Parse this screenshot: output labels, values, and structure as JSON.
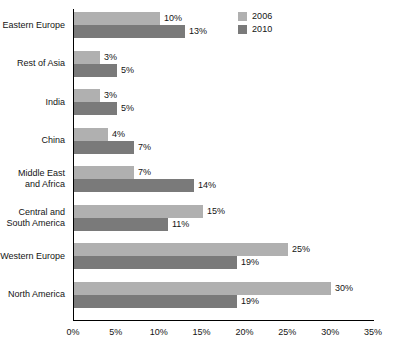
{
  "chart_data": {
    "type": "bar",
    "orientation": "horizontal",
    "title": "",
    "xlabel": "",
    "ylabel": "",
    "xlim": [
      0,
      35
    ],
    "grid": false,
    "legend_position": "top-right",
    "value_suffix": "%",
    "categories": [
      "Eastern Europe",
      "Rest of Asia",
      "India",
      "China",
      "Middle East\nand Africa",
      "Central and\nSouth America",
      "Western Europe",
      "North America"
    ],
    "series": [
      {
        "name": "2006",
        "color": "#b0b0b0",
        "values": [
          10,
          3,
          3,
          4,
          7,
          15,
          25,
          30
        ],
        "labels": [
          "10%",
          "3%",
          "3%",
          "4%",
          "7%",
          "15%",
          "25%",
          "30%"
        ]
      },
      {
        "name": "2010",
        "color": "#7a7a7a",
        "values": [
          13,
          5,
          5,
          7,
          14,
          11,
          19,
          19
        ],
        "labels": [
          "13%",
          "5%",
          "5%",
          "7%",
          "14%",
          "11%",
          "19%",
          "19%"
        ]
      }
    ],
    "xticks": [
      0,
      5,
      10,
      15,
      20,
      25,
      30,
      35
    ],
    "xtick_labels": [
      "0%",
      "5%",
      "10%",
      "15%",
      "20%",
      "25%",
      "30%",
      "35%"
    ]
  },
  "legend": {
    "items": [
      {
        "label": "2006",
        "color": "#b0b0b0"
      },
      {
        "label": "2010",
        "color": "#7a7a7a"
      }
    ]
  },
  "axis": {
    "line_color": "#000000"
  }
}
